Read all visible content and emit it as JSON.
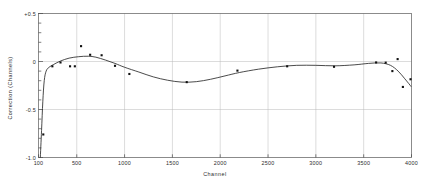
{
  "chart_data": {
    "type": "scatter",
    "title": "",
    "xlabel": "Channel",
    "ylabel": "Correction  (Channels)",
    "xlim": [
      100,
      4000
    ],
    "ylim": [
      -1.0,
      0.5
    ],
    "grid": true,
    "legend": "none",
    "xticks": [
      100,
      500,
      1000,
      1500,
      2000,
      2500,
      3000,
      3500,
      4000
    ],
    "xtick_labels": [
      "100",
      "500",
      "1000",
      "1500",
      "2000",
      "2500",
      "3000",
      "3500",
      "4000"
    ],
    "yticks": [
      0.5,
      0.0,
      -0.5,
      -1.0
    ],
    "ytick_labels": [
      "+0.5",
      "0",
      "-0.5",
      "-1.0"
    ],
    "y_minor_step": 0.1,
    "gridlines_x": [
      500,
      1000,
      1500,
      2000,
      2500,
      3000,
      3500
    ],
    "gridlines_y": [
      0.0,
      -0.5
    ],
    "series": [
      {
        "name": "measured correction",
        "marker": "square",
        "marker_color": "#101010",
        "points": [
          {
            "x": 150,
            "y": -0.76
          },
          {
            "x": 245,
            "y": -0.05
          },
          {
            "x": 330,
            "y": -0.01
          },
          {
            "x": 430,
            "y": -0.05
          },
          {
            "x": 480,
            "y": -0.05
          },
          {
            "x": 545,
            "y": 0.16
          },
          {
            "x": 640,
            "y": 0.07
          },
          {
            "x": 760,
            "y": 0.065
          },
          {
            "x": 900,
            "y": -0.045
          },
          {
            "x": 1050,
            "y": -0.13
          },
          {
            "x": 1650,
            "y": -0.215
          },
          {
            "x": 2180,
            "y": -0.095
          },
          {
            "x": 2700,
            "y": -0.05
          },
          {
            "x": 3190,
            "y": -0.055
          },
          {
            "x": 3630,
            "y": -0.01
          },
          {
            "x": 3730,
            "y": -0.012
          },
          {
            "x": 3800,
            "y": -0.1
          },
          {
            "x": 3855,
            "y": 0.025
          },
          {
            "x": 3910,
            "y": -0.265
          },
          {
            "x": 3990,
            "y": -0.185
          }
        ]
      },
      {
        "name": "fitted curve",
        "marker": "none",
        "line_color": "#2a2a2a",
        "points": [
          {
            "x": 118,
            "y": -1.02
          },
          {
            "x": 132,
            "y": -0.72
          },
          {
            "x": 145,
            "y": -0.42
          },
          {
            "x": 160,
            "y": -0.2
          },
          {
            "x": 180,
            "y": -0.1
          },
          {
            "x": 210,
            "y": -0.06
          },
          {
            "x": 260,
            "y": -0.03
          },
          {
            "x": 330,
            "y": 0.005
          },
          {
            "x": 420,
            "y": 0.035
          },
          {
            "x": 520,
            "y": 0.05
          },
          {
            "x": 620,
            "y": 0.055
          },
          {
            "x": 700,
            "y": 0.045
          },
          {
            "x": 800,
            "y": 0.015
          },
          {
            "x": 900,
            "y": -0.02
          },
          {
            "x": 1000,
            "y": -0.06
          },
          {
            "x": 1150,
            "y": -0.11
          },
          {
            "x": 1300,
            "y": -0.16
          },
          {
            "x": 1450,
            "y": -0.195
          },
          {
            "x": 1600,
            "y": -0.215
          },
          {
            "x": 1750,
            "y": -0.21
          },
          {
            "x": 1900,
            "y": -0.185
          },
          {
            "x": 2050,
            "y": -0.15
          },
          {
            "x": 2200,
            "y": -0.115
          },
          {
            "x": 2400,
            "y": -0.08
          },
          {
            "x": 2600,
            "y": -0.055
          },
          {
            "x": 2800,
            "y": -0.04
          },
          {
            "x": 3000,
            "y": -0.04
          },
          {
            "x": 3200,
            "y": -0.045
          },
          {
            "x": 3400,
            "y": -0.035
          },
          {
            "x": 3550,
            "y": -0.02
          },
          {
            "x": 3680,
            "y": -0.015
          },
          {
            "x": 3780,
            "y": -0.04
          },
          {
            "x": 3860,
            "y": -0.1
          },
          {
            "x": 3930,
            "y": -0.18
          },
          {
            "x": 4000,
            "y": -0.265
          }
        ]
      }
    ]
  }
}
